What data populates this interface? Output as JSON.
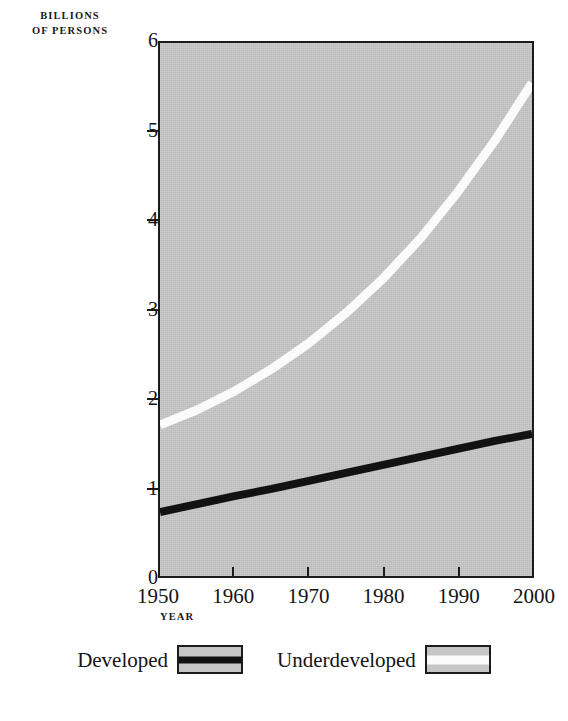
{
  "chart_data": {
    "type": "line",
    "title": "",
    "ylabel": "BILLIONS OF PERSONS",
    "ylabel_line1": "BILLIONS",
    "ylabel_line2": "OF PERSONS",
    "xlabel": "YEAR",
    "xlim": [
      1950,
      2000
    ],
    "ylim": [
      0,
      6
    ],
    "grid": false,
    "legend_position": "bottom",
    "plot_background": "#c6c6c6",
    "x_ticks": [
      {
        "value": 1950,
        "label": "1950"
      },
      {
        "value": 1960,
        "label": "1960"
      },
      {
        "value": 1970,
        "label": "1970"
      },
      {
        "value": 1980,
        "label": "1980"
      },
      {
        "value": 1990,
        "label": "1990"
      },
      {
        "value": 2000,
        "label": "2000"
      }
    ],
    "y_ticks": [
      {
        "value": 0,
        "label": "0"
      },
      {
        "value": 1,
        "label": "1"
      },
      {
        "value": 2,
        "label": "2"
      },
      {
        "value": 3,
        "label": "3"
      },
      {
        "value": 4,
        "label": "4"
      },
      {
        "value": 5,
        "label": "5"
      },
      {
        "value": 6,
        "label": "6"
      }
    ],
    "x": [
      1950,
      1955,
      1960,
      1965,
      1970,
      1975,
      1980,
      1985,
      1990,
      1995,
      2000
    ],
    "series": [
      {
        "name": "Developed",
        "color": "#121212",
        "values": [
          0.72,
          0.81,
          0.9,
          0.98,
          1.07,
          1.16,
          1.25,
          1.34,
          1.43,
          1.52,
          1.6
        ]
      },
      {
        "name": "Underdeveloped",
        "color": "#fbfbfb",
        "values": [
          1.7,
          1.87,
          2.08,
          2.33,
          2.62,
          2.96,
          3.35,
          3.8,
          4.32,
          4.9,
          5.55
        ]
      }
    ]
  },
  "legend": {
    "entries": [
      {
        "label": "Developed",
        "swatch": "black-line"
      },
      {
        "label": "Underdeveloped",
        "swatch": "white-line"
      }
    ]
  }
}
